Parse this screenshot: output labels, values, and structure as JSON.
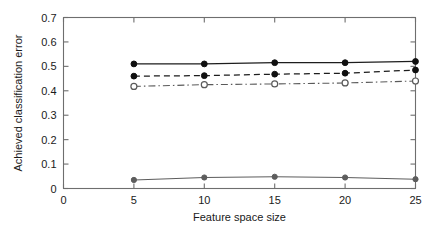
{
  "chart_data": {
    "type": "line",
    "title": "",
    "xlabel": "Feature space size",
    "ylabel": "Achieved classification error",
    "xlim": [
      0,
      25
    ],
    "ylim": [
      0,
      0.7
    ],
    "x": [
      5,
      10,
      15,
      20,
      25
    ],
    "xticks": [
      0,
      5,
      10,
      15,
      20,
      25
    ],
    "xtick_labels": [
      "0",
      "5",
      "10",
      "15",
      "20",
      "25"
    ],
    "yticks": [
      0,
      0.1,
      0.2,
      0.3,
      0.4,
      0.5,
      0.6,
      0.7
    ],
    "ytick_labels": [
      "0",
      "0.1",
      "0.2",
      "0.3",
      "0.4",
      "0.5",
      "0.6",
      "0.7"
    ],
    "grid": false,
    "legend": "none",
    "series": [
      {
        "name": "series-1",
        "linestyle": "solid",
        "marker": "filled-circle",
        "color": "#101010",
        "values": [
          0.51,
          0.51,
          0.515,
          0.515,
          0.52
        ]
      },
      {
        "name": "series-2",
        "linestyle": "dashed",
        "marker": "filled-circle",
        "color": "#1d1d1d",
        "values": [
          0.46,
          0.462,
          0.468,
          0.472,
          0.485
        ]
      },
      {
        "name": "series-3",
        "linestyle": "dash-dot",
        "marker": "open-circle",
        "color": "#5a5a5a",
        "values": [
          0.418,
          0.425,
          0.428,
          0.432,
          0.44
        ]
      },
      {
        "name": "series-4",
        "linestyle": "solid",
        "marker": "filled-circle",
        "color": "#5d5d5d",
        "values": [
          0.035,
          0.045,
          0.048,
          0.045,
          0.038
        ]
      }
    ]
  }
}
